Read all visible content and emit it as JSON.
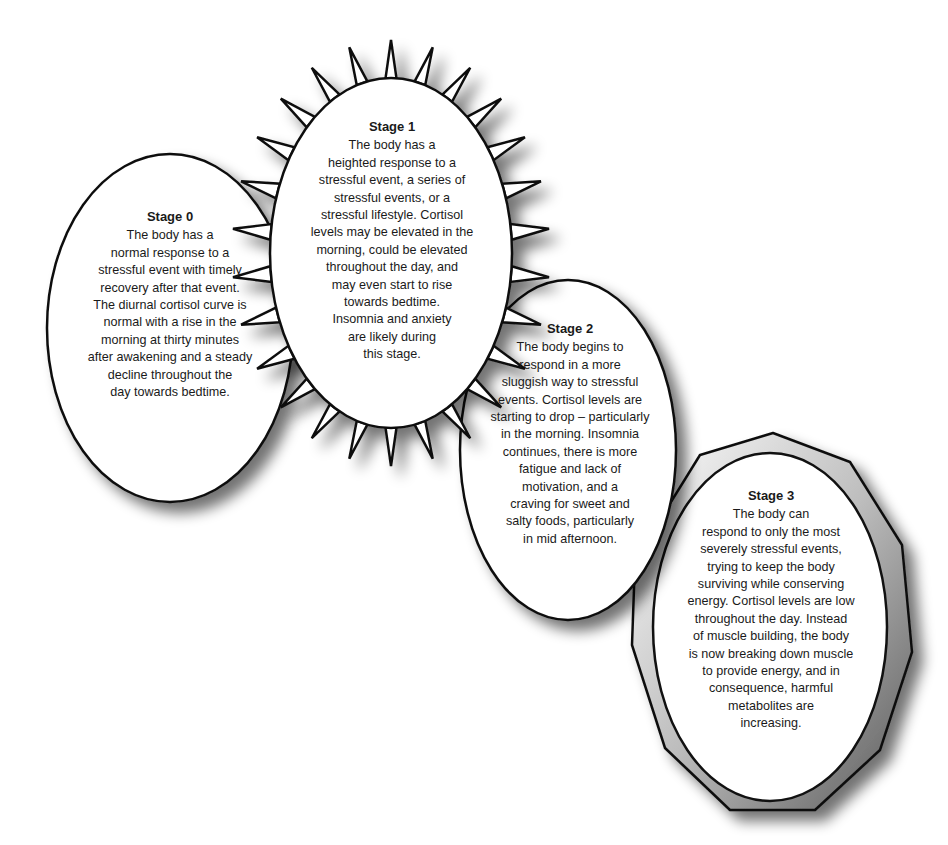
{
  "diagram": {
    "type": "stress-stages-flow",
    "colors": {
      "outline": "#111111",
      "fill": "#ffffff",
      "shadow": "#8a8a8a",
      "background": "#ffffff"
    },
    "stages": [
      {
        "id": "stage-0",
        "title": "Stage 0",
        "shape": "ellipse",
        "body": "The body has a\nnormal response to a\nstressful event with timely\nrecovery after that event.\nThe diurnal cortisol curve is\nnormal with a rise in the\nmorning at thirty minutes\nafter awakening and a steady\ndecline throughout the\nday towards bedtime."
      },
      {
        "id": "stage-1",
        "title": "Stage 1",
        "shape": "spiked-ellipse",
        "body": "The body has a\nheighted response to a\nstressful event, a series of\nstressful events, or a\nstressful lifestyle. Cortisol\nlevels may be elevated in the\nmorning, could be elevated\nthroughout the day, and\nmay even start to rise\ntowards bedtime.\nInsomnia and anxiety\nare likely during\nthis stage."
      },
      {
        "id": "stage-2",
        "title": "Stage 2",
        "shape": "ellipse",
        "body": "The body begins to\nrespond in a more\nsluggish way to stressful\nevents. Cortisol levels are\nstarting to drop – particularly\nin the morning. Insomnia\ncontinues, there is more\nfatigue and lack of\nmotivation, and a\ncraving for sweet and\nsalty foods, particularly\nin mid afternoon."
      },
      {
        "id": "stage-3",
        "title": "Stage 3",
        "shape": "ellipse-in-polygon",
        "body": "The body can\nrespond to only the most\nseverely stressful events,\ntrying to keep the body\nsurviving while conserving\nenergy. Cortisol levels are low\nthroughout the day. Instead\nof muscle building, the body\nis now breaking down muscle\nto provide energy, and in\nconsequence, harmful\nmetabolites are\nincreasing."
      }
    ]
  }
}
